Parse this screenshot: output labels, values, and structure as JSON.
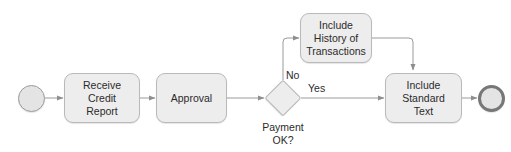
{
  "diagram": {
    "type": "bpmn-process-flow",
    "background_color": "#ffffff",
    "shape_fill_color": "#ededed",
    "shape_border_color": "#b9b9b9",
    "connector_color": "#9a9a9a",
    "text_color": "#2b2b2b",
    "nodes": {
      "start_event": {
        "label": "",
        "shape": "circle"
      },
      "task_receive": {
        "line1": "Receive",
        "line2": "Credit Report",
        "shape": "rounded-rectangle"
      },
      "task_approval": {
        "line1": "Approval",
        "shape": "rounded-rectangle"
      },
      "gateway": {
        "label_line1": "Payment",
        "label_line2": "OK?",
        "shape": "diamond"
      },
      "task_history": {
        "line1": "Include",
        "line2": "History of",
        "line3": "Transactions",
        "shape": "rounded-rectangle"
      },
      "task_standard": {
        "line1": "Include",
        "line2": "Standard Text",
        "shape": "rounded-rectangle"
      },
      "end_event": {
        "label": "",
        "shape": "thick-circle"
      }
    },
    "edge_labels": {
      "no": "No",
      "yes": "Yes"
    }
  }
}
